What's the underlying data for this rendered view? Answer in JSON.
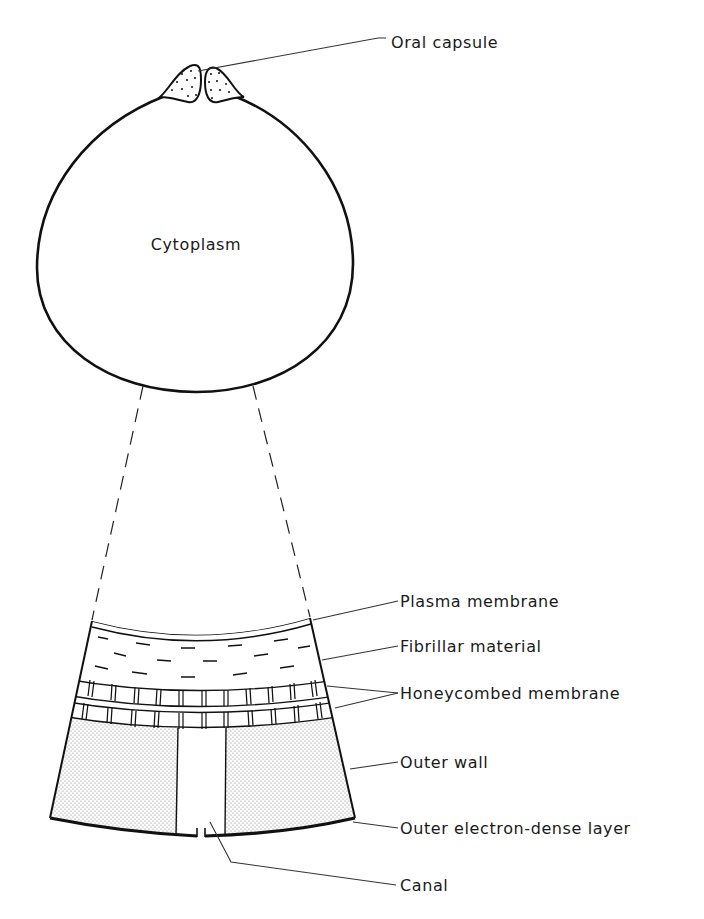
{
  "diagram": {
    "cell": {
      "center_label": "Cytoplasm"
    },
    "labels": {
      "oral_capsule": "Oral capsule",
      "plasma_membrane": "Plasma membrane",
      "fibrillar_material": "Fibrillar material",
      "honeycombed_membrane": "Honeycombed membrane",
      "outer_wall": "Outer wall",
      "outer_electron_dense_layer": "Outer electron-dense layer",
      "canal": "Canal"
    },
    "colors": {
      "line": "#111111",
      "stipple": "#9a9a9a",
      "background": "#ffffff"
    }
  }
}
